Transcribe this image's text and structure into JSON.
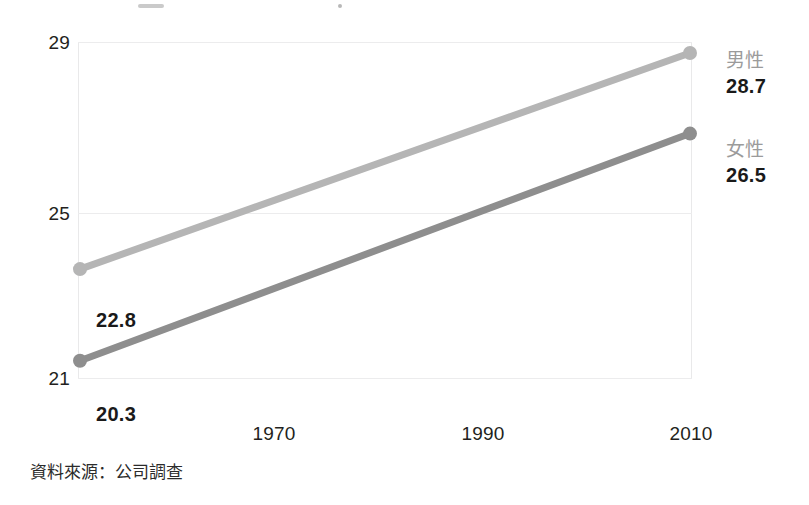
{
  "chart_data": {
    "type": "line",
    "title": "",
    "xlabel": "",
    "ylabel": "",
    "x": [
      1965,
      2009
    ],
    "xlim": [
      1965,
      2009
    ],
    "ylim": [
      19.8,
      29
    ],
    "grid": true,
    "xticks": [
      "1970",
      "1990",
      "2010"
    ],
    "xtick_values": [
      1970,
      1990,
      2010
    ],
    "yticks": [
      "29",
      "25",
      "21"
    ],
    "ytick_values": [
      29,
      25,
      21
    ],
    "legend_position": "right",
    "series": [
      {
        "name": "男性",
        "color": "#b5b5b5",
        "values": [
          22.8,
          28.7
        ],
        "start_label": "22.8",
        "end_label": "28.7"
      },
      {
        "name": "女性",
        "color": "#8e8e8e",
        "values": [
          20.3,
          26.5
        ],
        "start_label": "20.3",
        "end_label": "26.5"
      }
    ],
    "source_note": "資料來源：公司調查"
  },
  "legend_strip": {
    "items": [
      {
        "label": "",
        "color": "#9e9e9e"
      },
      {
        "label": "",
        "color": "#7d7d7d"
      }
    ]
  }
}
